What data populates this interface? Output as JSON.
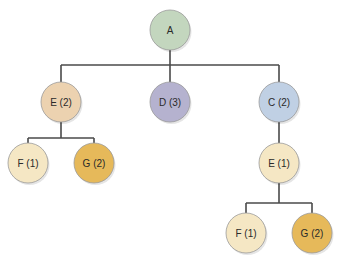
{
  "diagram": {
    "type": "tree",
    "edge_color": "#4a4a4a",
    "node_radius": 20,
    "nodes": [
      {
        "id": "A",
        "label": "A",
        "x": 170,
        "y": 30,
        "color": "#c3d6be"
      },
      {
        "id": "E2",
        "label": "E (2)",
        "x": 61,
        "y": 102,
        "color": "#ecd2b0"
      },
      {
        "id": "D3",
        "label": "D (3)",
        "x": 170,
        "y": 102,
        "color": "#b5b2cf"
      },
      {
        "id": "C2",
        "label": "C (2)",
        "x": 279,
        "y": 102,
        "color": "#c0d0e4"
      },
      {
        "id": "F1a",
        "label": "F (1)",
        "x": 28,
        "y": 163,
        "color": "#f5e7c4"
      },
      {
        "id": "G2a",
        "label": "G (2)",
        "x": 94,
        "y": 163,
        "color": "#e6b95a"
      },
      {
        "id": "E1",
        "label": "E (1)",
        "x": 279,
        "y": 163,
        "color": "#f5e7c4"
      },
      {
        "id": "F1b",
        "label": "F (1)",
        "x": 246,
        "y": 233,
        "color": "#f5e7c4"
      },
      {
        "id": "G2b",
        "label": "G (2)",
        "x": 312,
        "y": 233,
        "color": "#e6b95a"
      }
    ],
    "edges": [
      {
        "parent": "A",
        "children": [
          "E2",
          "D3",
          "C2"
        ],
        "bar_y": 65
      },
      {
        "parent": "E2",
        "children": [
          "F1a",
          "G2a"
        ],
        "bar_y": 138
      },
      {
        "parent": "C2",
        "children": [
          "E1"
        ],
        "bar_y": 138
      },
      {
        "parent": "E1",
        "children": [
          "F1b",
          "G2b"
        ],
        "bar_y": 203
      }
    ]
  }
}
